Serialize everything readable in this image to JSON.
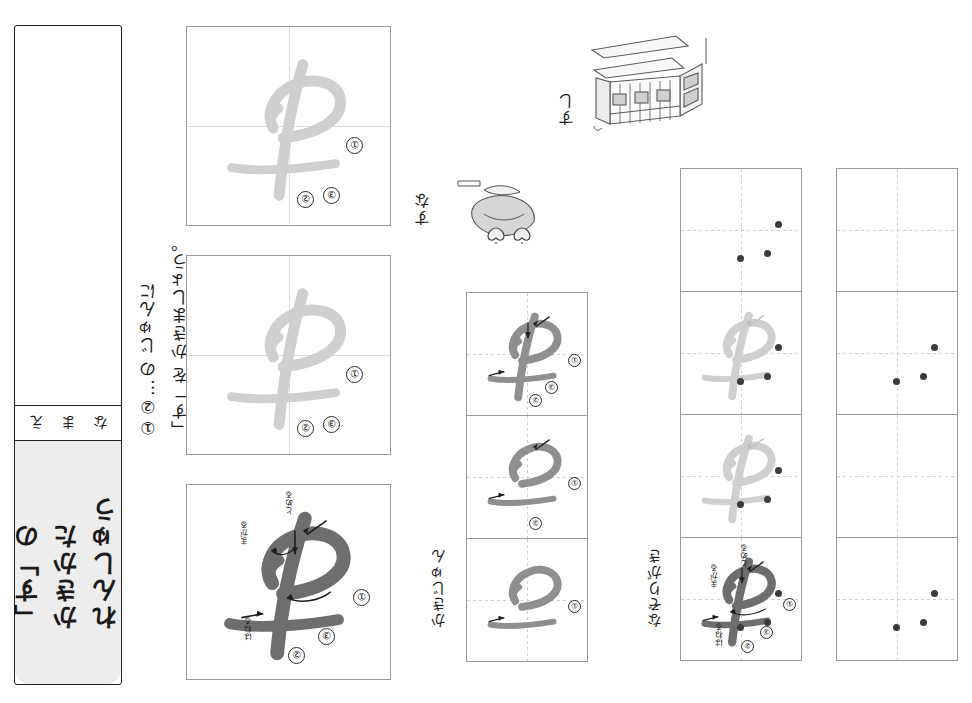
{
  "sheet": {
    "subject": "hiragana-handwriting-practice",
    "target_character": "す",
    "orientation_note": "printed-upside-down"
  },
  "name_panel": {
    "name_label": [
      "な",
      "ま",
      "え"
    ],
    "title": "「す」の\nかきかた\nれんしゅう"
  },
  "instruction": {
    "line": "①②…の じゅんに\n「す」を かきましょう。",
    "boxed_char": "す",
    "numbers": [
      "①",
      "②"
    ]
  },
  "labels": {
    "stroke_order": "かきじゅん",
    "tracing": "なぞりがき"
  },
  "stroke_numbers": [
    "①",
    "②",
    "③"
  ],
  "hints": {
    "tome": "とめる",
    "hane": "はねる",
    "magaru": "まがる"
  },
  "picture_words": [
    {
      "word": "すし",
      "illustration": "sushi-shop-icon"
    },
    {
      "word": "すな",
      "illustration": "sand-shovel-icon"
    }
  ],
  "columns": {
    "model_column": {
      "label": "model-large-cells",
      "cells": [
        {
          "shade": "light",
          "numbers": true,
          "hints": false
        },
        {
          "shade": "light",
          "numbers": true,
          "hints": false
        },
        {
          "shade": "dark",
          "numbers": true,
          "hints": true
        }
      ]
    },
    "stroke_order_column": {
      "label": "かきじゅん",
      "cells": [
        {
          "strokes": 3,
          "shade": "mid"
        },
        {
          "strokes": 2,
          "shade": "mid"
        },
        {
          "strokes": 1,
          "shade": "mid"
        }
      ]
    },
    "tracing_column": {
      "label": "なぞりがき",
      "cells": [
        {
          "strokes": 0,
          "shade": "none",
          "dots": 3
        },
        {
          "strokes": 3,
          "shade": "light",
          "dots": 3
        },
        {
          "strokes": 3,
          "shade": "light",
          "dots": 3
        },
        {
          "strokes": 3,
          "shade": "dark",
          "dots": 3,
          "numbers": true,
          "hints": true
        }
      ]
    },
    "free_write_column": {
      "label": "free-practice",
      "cells": [
        {
          "strokes": 0,
          "dots": 0
        },
        {
          "strokes": 0,
          "dots": 3
        },
        {
          "strokes": 0,
          "dots": 0
        },
        {
          "strokes": 0,
          "dots": 3
        }
      ]
    }
  },
  "colors": {
    "ink_dark": "#6e6e6e",
    "ink_light": "#cfcfcf",
    "ink_mid": "#8f8f8f",
    "grid": "#9a9a9a",
    "grid_inner": "#d9d9d9",
    "dot": "#3b3b3b",
    "title_bg": "#ededed"
  }
}
